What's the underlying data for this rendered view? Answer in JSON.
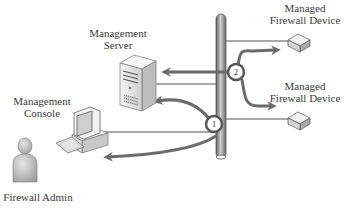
{
  "labels": {
    "management_server": [
      "Management",
      "Server"
    ],
    "management_console": [
      "Management",
      "Console"
    ],
    "firewall_admin": "Firewall Admin",
    "managed_device_top": [
      "Managed",
      "Firewall Device"
    ],
    "managed_device_bottom": [
      "Managed",
      "Firewall Device"
    ]
  },
  "steps": {
    "step1": "1",
    "step2": "2"
  },
  "colors": {
    "arrow": "#6b6b6b",
    "line": "#555555",
    "pipe_dark": "#6e6e6e",
    "pipe_light": "#c9c9c9",
    "device_fill": "#e8e8e8"
  },
  "nodes": [
    {
      "id": "firewall-admin",
      "icon": "person-icon"
    },
    {
      "id": "management-console",
      "icon": "desktop-computer-icon"
    },
    {
      "id": "management-server",
      "icon": "server-tower-icon"
    },
    {
      "id": "network-backbone",
      "icon": "pipe-bus-icon"
    },
    {
      "id": "managed-firewall-top",
      "icon": "firewall-appliance-icon"
    },
    {
      "id": "managed-firewall-bottom",
      "icon": "firewall-appliance-icon"
    }
  ]
}
